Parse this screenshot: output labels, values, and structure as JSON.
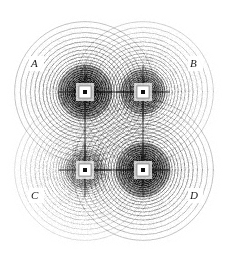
{
  "figure": {
    "background_color": "#ffffff",
    "ink_color": "#000000",
    "width": 229,
    "height": 256
  },
  "chart_data": {
    "type": "scatter",
    "title": "",
    "subtitle": "",
    "xlabel": "",
    "ylabel": "",
    "grid": false,
    "legend_position": "none",
    "axis_visible": false,
    "xlim": [
      0,
      229
    ],
    "ylim": [
      0,
      256
    ],
    "series": [
      {
        "name": "A",
        "label": "A",
        "label_x": 36,
        "label_y": 64,
        "center_x": 85,
        "center_y": 92,
        "marker": "square-with-dot",
        "marker_size": 13,
        "ring_count": 34,
        "ring_spacing_min": 1.4,
        "ring_spacing_max": 10,
        "outer_radius": 76,
        "intensity": "dark",
        "values": [
          85,
          92
        ]
      },
      {
        "name": "B",
        "label": "B",
        "label_x": 195,
        "label_y": 64,
        "center_x": 143,
        "center_y": 92,
        "marker": "square-with-dot",
        "marker_size": 13,
        "ring_count": 34,
        "ring_spacing_min": 1.4,
        "ring_spacing_max": 10,
        "outer_radius": 76,
        "intensity": "medium",
        "values": [
          143,
          92
        ]
      },
      {
        "name": "C",
        "label": "C",
        "label_x": 36,
        "label_y": 196,
        "center_x": 85,
        "center_y": 170,
        "marker": "square-with-dot",
        "marker_size": 13,
        "ring_count": 34,
        "ring_spacing_min": 1.4,
        "ring_spacing_max": 10,
        "outer_radius": 76,
        "intensity": "light",
        "values": [
          85,
          170
        ]
      },
      {
        "name": "D",
        "label": "D",
        "label_x": 195,
        "label_y": 196,
        "center_x": 143,
        "center_y": 170,
        "marker": "square-with-dot",
        "marker_size": 13,
        "ring_count": 34,
        "ring_spacing_min": 1.4,
        "ring_spacing_max": 10,
        "outer_radius": 76,
        "intensity": "dark",
        "values": [
          143,
          170
        ]
      }
    ],
    "annotations": [
      {
        "text": "A",
        "x": 36,
        "y": 64
      },
      {
        "text": "B",
        "x": 195,
        "y": 64
      },
      {
        "text": "C",
        "x": 36,
        "y": 196
      },
      {
        "text": "D",
        "x": 195,
        "y": 196
      }
    ]
  },
  "labels": {
    "a": "A",
    "b": "B",
    "c": "C",
    "d": "D"
  }
}
